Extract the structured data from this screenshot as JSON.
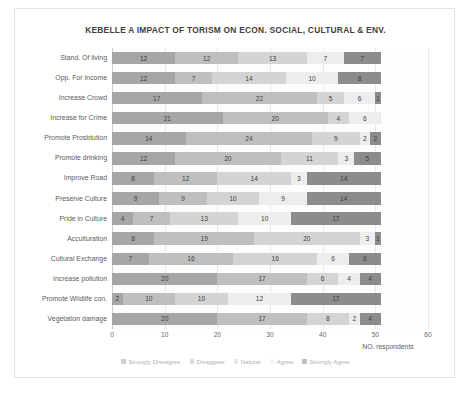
{
  "chart_data": {
    "type": "bar",
    "subtype": "stacked-horizontal-100-count",
    "title": "KEBELLE A IMPACT OF TORISM ON ECON. SOCIAL, CULTURAL & ENV.",
    "xlabel": "NO. respondents",
    "ylabel": "",
    "xlim": [
      0,
      60
    ],
    "xticks": [
      "0",
      "10",
      "20",
      "30",
      "40",
      "50",
      "60"
    ],
    "grid": true,
    "legend_position": "bottom",
    "categories": [
      "Stand. Of living",
      "Opp. For Income",
      "Increase Crowd",
      "Increase for Crime",
      "Promote Prosbtution",
      "Promote drinking",
      "Improve Road",
      "Preserve Culture",
      "Pride in Culture",
      "Acculturation",
      "Cultural Exchange",
      "Increase pollution",
      "Promote Wildlife con.",
      "Vegetation damage"
    ],
    "series": [
      {
        "name": "Strongly Dissagree",
        "color": "#a6a6a6",
        "values": [
          12,
          12,
          17,
          21,
          14,
          12,
          8,
          9,
          4,
          8,
          7,
          20,
          2,
          20
        ]
      },
      {
        "name": "Disaggree",
        "color": "#bfbfbf",
        "values": [
          12,
          7,
          22,
          20,
          24,
          20,
          12,
          9,
          7,
          19,
          16,
          17,
          10,
          17
        ]
      },
      {
        "name": "Natural",
        "color": "#d4d4d4",
        "values": [
          13,
          14,
          5,
          4,
          9,
          11,
          14,
          10,
          13,
          20,
          16,
          6,
          10,
          8
        ]
      },
      {
        "name": "Agree",
        "color": "#ededed",
        "values": [
          7,
          10,
          6,
          6,
          2,
          3,
          3,
          9,
          10,
          3,
          6,
          4,
          12,
          2
        ]
      },
      {
        "name": "Strongly Agree",
        "color": "#8c8c8c",
        "values": [
          7,
          8,
          1,
          0,
          2,
          5,
          14,
          14,
          17,
          1,
          6,
          4,
          17,
          4
        ]
      }
    ]
  }
}
